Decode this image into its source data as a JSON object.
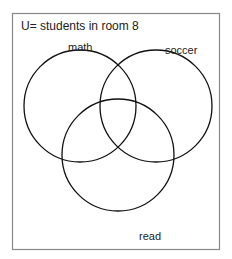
{
  "diagram": {
    "type": "venn",
    "universe_label": "U= students in room 8",
    "sets": [
      {
        "name": "math",
        "label": "math"
      },
      {
        "name": "soccer",
        "label": "soccer"
      },
      {
        "name": "read",
        "label": "read"
      }
    ],
    "colors": {
      "frame": "#888888",
      "circle": "#111111",
      "text": "#222222"
    }
  }
}
